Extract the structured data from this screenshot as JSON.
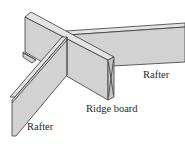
{
  "figure": {
    "labels": {
      "rafter_right": "Rafter",
      "ridge_board": "Ridge board",
      "rafter_left": "Rafter"
    },
    "colors": {
      "board_face": "#d2d2d2",
      "board_top": "#e4e4e4",
      "board_end": "#c4c4c4",
      "outline": "#3a3a3a",
      "background": "#ffffff"
    }
  }
}
